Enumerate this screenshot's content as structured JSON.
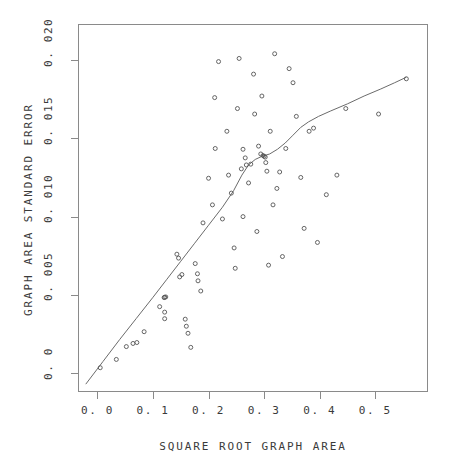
{
  "chart_data": {
    "type": "scatter",
    "title": "",
    "xlabel": "SQUARE ROOT GRAPH AREA",
    "ylabel": "GRAPH AREA STANDARD ERROR",
    "xlim": [
      -0.035,
      0.595
    ],
    "ylim": [
      -0.0012,
      0.0223
    ],
    "xticks": [
      0.0,
      0.1,
      0.2,
      0.3,
      0.4,
      0.5
    ],
    "xticklabels": [
      "0. 0",
      "0. 1",
      "0. 2",
      "0. 3",
      "0. 4",
      "0. 5"
    ],
    "yticks": [
      0.0,
      0.005,
      0.01,
      0.015,
      0.02
    ],
    "yticklabels": [
      "0. 0",
      "0. 005",
      "0. 010",
      "0. 015",
      "0. 020"
    ],
    "grid": false,
    "legend": false,
    "marker": "open-circle",
    "marker_size": 4,
    "point_color": "#555555",
    "line_color": "#6b6b6b",
    "frame_color": "#8a8a8a",
    "background": "#ffffff",
    "points": [
      [
        0.005,
        0.00035
      ],
      [
        0.034,
        0.00088
      ],
      [
        0.052,
        0.0017
      ],
      [
        0.064,
        0.0019
      ],
      [
        0.071,
        0.00196
      ],
      [
        0.084,
        0.00265
      ],
      [
        0.112,
        0.00425
      ],
      [
        0.12,
        0.00483
      ],
      [
        0.121,
        0.00485
      ],
      [
        0.121,
        0.0039
      ],
      [
        0.121,
        0.00348
      ],
      [
        0.148,
        0.00615
      ],
      [
        0.152,
        0.0063
      ],
      [
        0.176,
        0.007
      ],
      [
        0.18,
        0.00635
      ],
      [
        0.181,
        0.0059
      ],
      [
        0.186,
        0.00525
      ],
      [
        0.143,
        0.0076
      ],
      [
        0.146,
        0.00735
      ],
      [
        0.158,
        0.00345
      ],
      [
        0.16,
        0.003
      ],
      [
        0.163,
        0.00255
      ],
      [
        0.168,
        0.00165
      ],
      [
        0.19,
        0.0096
      ],
      [
        0.2,
        0.01245
      ],
      [
        0.207,
        0.01075
      ],
      [
        0.211,
        0.0176
      ],
      [
        0.212,
        0.01435
      ],
      [
        0.218,
        0.0199
      ],
      [
        0.225,
        0.00985
      ],
      [
        0.233,
        0.01545
      ],
      [
        0.236,
        0.01265
      ],
      [
        0.241,
        0.0115
      ],
      [
        0.246,
        0.008
      ],
      [
        0.248,
        0.0067
      ],
      [
        0.252,
        0.0169
      ],
      [
        0.255,
        0.0201
      ],
      [
        0.259,
        0.01305
      ],
      [
        0.262,
        0.01
      ],
      [
        0.266,
        0.01375
      ],
      [
        0.268,
        0.0133
      ],
      [
        0.272,
        0.01215
      ],
      [
        0.276,
        0.01335
      ],
      [
        0.281,
        0.0191
      ],
      [
        0.283,
        0.01655
      ],
      [
        0.287,
        0.00905
      ],
      [
        0.29,
        0.0145
      ],
      [
        0.296,
        0.0177
      ],
      [
        0.3,
        0.01385
      ],
      [
        0.302,
        0.0138
      ],
      [
        0.303,
        0.01345
      ],
      [
        0.305,
        0.0129
      ],
      [
        0.308,
        0.0069
      ],
      [
        0.311,
        0.01545
      ],
      [
        0.316,
        0.01075
      ],
      [
        0.319,
        0.0204
      ],
      [
        0.323,
        0.0118
      ],
      [
        0.328,
        0.01285
      ],
      [
        0.333,
        0.00745
      ],
      [
        0.339,
        0.01435
      ],
      [
        0.345,
        0.01945
      ],
      [
        0.352,
        0.01855
      ],
      [
        0.358,
        0.0164
      ],
      [
        0.366,
        0.0125
      ],
      [
        0.372,
        0.00925
      ],
      [
        0.381,
        0.01545
      ],
      [
        0.389,
        0.01565
      ],
      [
        0.396,
        0.00835
      ],
      [
        0.412,
        0.0114
      ],
      [
        0.431,
        0.01265
      ],
      [
        0.447,
        0.0169
      ],
      [
        0.506,
        0.01655
      ],
      [
        0.556,
        0.0188
      ],
      [
        0.123,
        0.00487
      ],
      [
        0.298,
        0.0139
      ],
      [
        0.294,
        0.014
      ],
      [
        0.262,
        0.0143
      ]
    ],
    "smooth_curve": [
      [
        -0.021,
        -0.0007
      ],
      [
        0.01,
        0.00075
      ],
      [
        0.04,
        0.00215
      ],
      [
        0.07,
        0.0035
      ],
      [
        0.1,
        0.00485
      ],
      [
        0.125,
        0.006
      ],
      [
        0.15,
        0.00715
      ],
      [
        0.175,
        0.0083
      ],
      [
        0.2,
        0.00945
      ],
      [
        0.225,
        0.0106
      ],
      [
        0.245,
        0.01165
      ],
      [
        0.26,
        0.01265
      ],
      [
        0.272,
        0.0133
      ],
      [
        0.284,
        0.01365
      ],
      [
        0.296,
        0.01385
      ],
      [
        0.31,
        0.014
      ],
      [
        0.324,
        0.0143
      ],
      [
        0.338,
        0.0147
      ],
      [
        0.352,
        0.0152
      ],
      [
        0.366,
        0.0157
      ],
      [
        0.38,
        0.01605
      ],
      [
        0.398,
        0.0164
      ],
      [
        0.42,
        0.01675
      ],
      [
        0.45,
        0.0172
      ],
      [
        0.48,
        0.0177
      ],
      [
        0.51,
        0.01815
      ],
      [
        0.535,
        0.01855
      ],
      [
        0.556,
        0.0189
      ]
    ]
  }
}
